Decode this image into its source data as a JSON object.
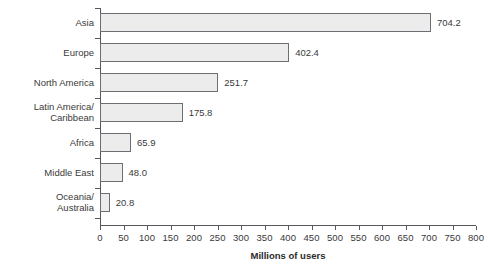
{
  "chart_data": {
    "type": "bar",
    "orientation": "horizontal",
    "title": "",
    "xlabel": "Millions of users",
    "ylabel": "",
    "xlim": [
      0,
      800
    ],
    "xticks": [
      0,
      50,
      100,
      150,
      200,
      250,
      300,
      350,
      400,
      450,
      500,
      550,
      600,
      650,
      700,
      750,
      800
    ],
    "grid": false,
    "legend": false,
    "categories": [
      "Asia",
      "Europe",
      "North America",
      "Latin America/\nCaribbean",
      "Africa",
      "Middle East",
      "Oceania/\nAustralia"
    ],
    "values": [
      704.2,
      402.4,
      251.7,
      175.8,
      65.9,
      48.0,
      20.8
    ],
    "value_labels": [
      "704.2",
      "402.4",
      "251.7",
      "175.8",
      "65.9",
      "48.0",
      "20.8"
    ],
    "bar_fill_color": "#ececec",
    "bar_border_color": "#6b6e72",
    "axis_color": "#55585c",
    "text_color": "#3a3a3a"
  }
}
